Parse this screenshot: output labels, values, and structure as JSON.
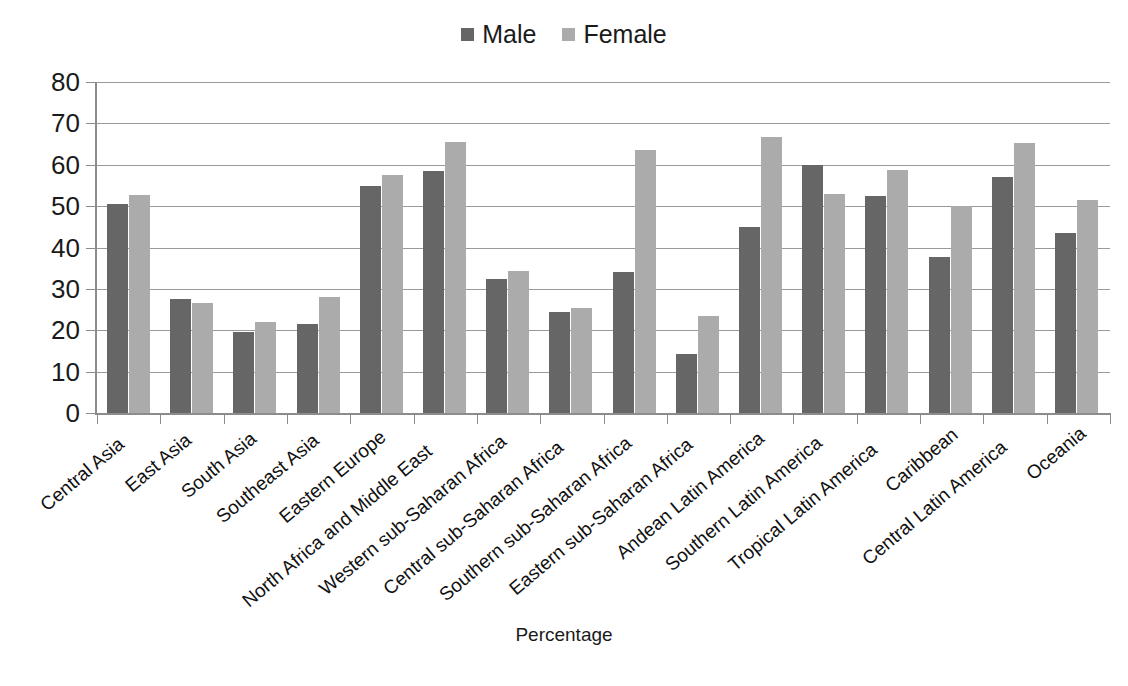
{
  "chart_data": {
    "type": "bar",
    "title": "",
    "xlabel": "Percentage",
    "ylabel": "",
    "ylim": [
      0,
      80
    ],
    "yticks": [
      0,
      10,
      20,
      30,
      40,
      50,
      60,
      70,
      80
    ],
    "grid": true,
    "legend_position": "top-center",
    "categories": [
      "Central Asia",
      "East Asia",
      "South Asia",
      "Southeast Asia",
      "Eastern Europe",
      "North Africa and Middle East",
      "Western sub-Saharan Africa",
      "Central sub-Saharan Africa",
      "Southern sub-Saharan Africa",
      "Eastern sub-Saharan Africa",
      "Andean Latin America",
      "Southern Latin America",
      "Tropical Latin America",
      "Caribbean",
      "Central Latin America",
      "Oceania"
    ],
    "series": [
      {
        "name": "Male",
        "color": "#666666",
        "values": [
          50.5,
          27.5,
          19.5,
          21.5,
          54.8,
          58.5,
          32.3,
          24.4,
          34.0,
          14.3,
          45.0,
          60.0,
          52.5,
          37.6,
          57.0,
          43.5
        ]
      },
      {
        "name": "Female",
        "color": "#ababab",
        "values": [
          52.6,
          26.6,
          22.1,
          28.0,
          57.6,
          65.4,
          34.3,
          25.4,
          63.6,
          23.4,
          66.6,
          53.0,
          58.8,
          50.0,
          65.2,
          51.4
        ]
      }
    ]
  },
  "legend": {
    "items": [
      {
        "label": "Male",
        "color": "#666666"
      },
      {
        "label": "Female",
        "color": "#ababab"
      }
    ]
  },
  "axis": {
    "x_title": "Percentage"
  }
}
